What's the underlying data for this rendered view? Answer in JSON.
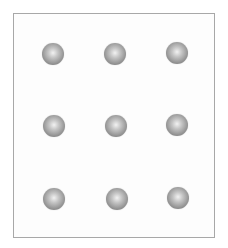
{
  "diagram": {
    "rows": 3,
    "cols": 3,
    "sphere_color": "#8e8e8e",
    "border_color": "#a8a8a8",
    "spheres": [
      {
        "row": 1,
        "col": 1,
        "cx": 53,
        "cy": 54
      },
      {
        "row": 1,
        "col": 2,
        "cx": 115,
        "cy": 54
      },
      {
        "row": 1,
        "col": 3,
        "cx": 177,
        "cy": 53
      },
      {
        "row": 2,
        "col": 1,
        "cx": 54,
        "cy": 126
      },
      {
        "row": 2,
        "col": 2,
        "cx": 116,
        "cy": 126
      },
      {
        "row": 2,
        "col": 3,
        "cx": 177,
        "cy": 125
      },
      {
        "row": 3,
        "col": 1,
        "cx": 54,
        "cy": 199
      },
      {
        "row": 3,
        "col": 2,
        "cx": 117,
        "cy": 199
      },
      {
        "row": 3,
        "col": 3,
        "cx": 178,
        "cy": 198
      }
    ]
  }
}
